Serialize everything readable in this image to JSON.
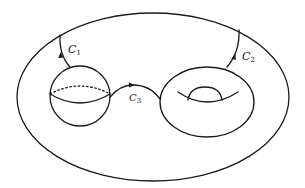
{
  "diagram": {
    "type": "topological-surface",
    "colors": {
      "stroke": "#1a1a1a",
      "background": "#ffffff"
    },
    "outer_surface": {
      "shape": "ellipse"
    },
    "components": [
      {
        "id": "sphere",
        "shape": "sphere-with-equator"
      },
      {
        "id": "torus",
        "shape": "torus"
      }
    ],
    "curves": [
      {
        "id": "C1",
        "label": "C",
        "subscript": "1",
        "from": "outer-surface",
        "to": "sphere",
        "arrow": "up"
      },
      {
        "id": "C2",
        "label": "C",
        "subscript": "2",
        "from": "torus",
        "to": "outer-surface",
        "arrow": "up"
      },
      {
        "id": "C3",
        "label": "C",
        "subscript": "3",
        "from": "sphere",
        "to": "torus",
        "arrow": "right"
      }
    ]
  }
}
